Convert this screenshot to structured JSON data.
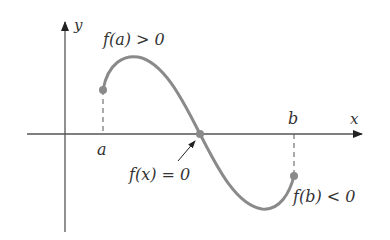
{
  "diagram": {
    "axes": {
      "x_label": "x",
      "y_label": "y"
    },
    "points": {
      "a_label": "a",
      "b_label": "b"
    },
    "annotations": {
      "fa": "f(a) > 0",
      "fb": "f(b) < 0",
      "root": "f(x) = 0"
    },
    "colors": {
      "axis": "#444444",
      "curve": "#8a8a8a",
      "point": "#8a8a8a",
      "text": "#333333"
    }
  }
}
